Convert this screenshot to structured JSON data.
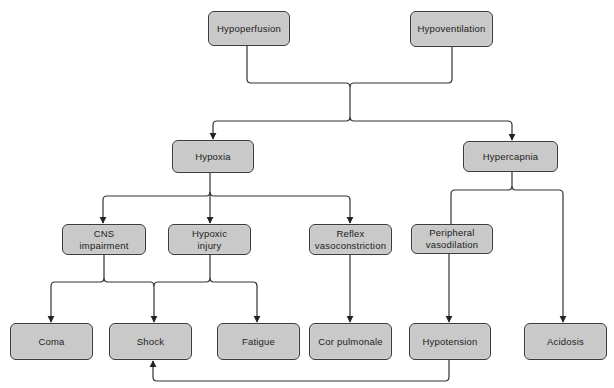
{
  "diagram": {
    "colors": {
      "node_fill": "#c9c9c9",
      "node_border": "#3a3a3a",
      "line": "#333333",
      "background": "#ffffff"
    },
    "nodes": {
      "hypoperfusion": {
        "label": "Hypoperfusion"
      },
      "hypoventilation": {
        "label": "Hypoventilation"
      },
      "hypoxia": {
        "label": "Hypoxia"
      },
      "hypercapnia": {
        "label": "Hypercapnia"
      },
      "cns_impairment": {
        "label": "CNS\nimpairment"
      },
      "hypoxic_injury": {
        "label": "Hypoxic\ninjury"
      },
      "reflex_vasoconstriction": {
        "label": "Reflex\nvasoconstriction"
      },
      "peripheral_vasodilation": {
        "label": "Peripheral\nvasodilation"
      },
      "coma": {
        "label": "Coma"
      },
      "shock": {
        "label": "Shock"
      },
      "fatigue": {
        "label": "Fatigue"
      },
      "cor_pulmonale": {
        "label": "Cor pulmonale"
      },
      "hypotension": {
        "label": "Hypotension"
      },
      "acidosis": {
        "label": "Acidosis"
      }
    },
    "edges": [
      {
        "from": [
          "Hypoperfusion",
          "Hypoventilation"
        ],
        "to": [
          "Hypoxia",
          "Hypercapnia"
        ]
      },
      {
        "from": "Hypoxia",
        "to": [
          "CNS impairment",
          "Hypoxic injury",
          "Reflex vasoconstriction"
        ]
      },
      {
        "from": "Hypercapnia",
        "to": [
          "Peripheral vasodilation",
          "Acidosis"
        ]
      },
      {
        "from": [
          "CNS impairment",
          "Hypoxic injury"
        ],
        "to": [
          "Coma",
          "Shock",
          "Fatigue"
        ]
      },
      {
        "from": "Reflex vasoconstriction",
        "to": "Cor pulmonale"
      },
      {
        "from": "Peripheral vasodilation",
        "to": "Hypotension"
      },
      {
        "from": "Hypotension",
        "to": "Shock"
      }
    ]
  }
}
